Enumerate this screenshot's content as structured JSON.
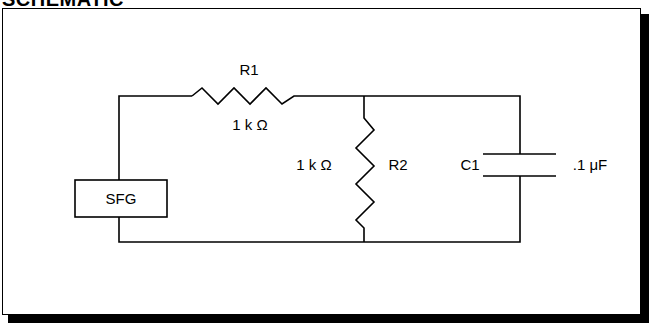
{
  "heading": "SCHEMATIC",
  "components": {
    "source": {
      "label": "SFG"
    },
    "r1": {
      "name": "R1",
      "value": "1 k Ω"
    },
    "r2": {
      "name": "R2",
      "value": "1 k Ω"
    },
    "c1": {
      "name": "C1",
      "value": ".1 μF"
    }
  },
  "colors": {
    "line": "#000000",
    "background": "#ffffff"
  }
}
